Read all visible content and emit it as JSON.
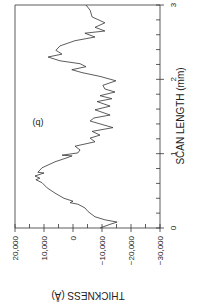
{
  "chart_data": {
    "type": "line",
    "orientation": "rotated-90",
    "panel_label": "(b)",
    "title": "",
    "xlabel": "SCAN LENGTH (mm)",
    "ylabel": "THICKNESS (Å)",
    "xlim": [
      0,
      3
    ],
    "ylim": [
      -30000,
      20000
    ],
    "x_ticks": [
      "0",
      "1",
      "2",
      "3"
    ],
    "y_ticks": [
      "20,000",
      "10,000",
      "0",
      "-10,000",
      "-20,000",
      "-30,000"
    ],
    "grid": false,
    "legend": null,
    "series": [
      {
        "name": "thickness profile",
        "x": [
          0.0,
          0.05,
          0.08,
          0.11,
          0.15,
          0.22,
          0.27,
          0.32,
          0.34,
          0.36,
          0.4,
          0.47,
          0.54,
          0.61,
          0.65,
          0.67,
          0.7,
          0.74,
          0.75,
          0.81,
          0.89,
          0.94,
          0.97,
          0.98,
          1.01,
          1.05,
          1.1,
          1.16,
          1.21,
          1.25,
          1.3,
          1.35,
          1.4,
          1.44,
          1.48,
          1.52,
          1.59,
          1.64,
          1.7,
          1.74,
          1.78,
          1.83,
          1.87,
          1.92,
          1.98,
          2.04,
          2.09,
          2.13,
          2.17,
          2.21,
          2.25,
          2.3,
          2.34,
          2.39,
          2.45,
          2.52,
          2.57,
          2.62,
          2.65,
          2.7,
          2.76,
          2.84,
          2.93,
          3.0
        ],
        "y": [
          -9300,
          -12800,
          -15200,
          -11000,
          -7600,
          -5200,
          -4100,
          -1700,
          1000,
          0,
          3100,
          6200,
          8900,
          10700,
          12800,
          11400,
          13100,
          10000,
          12100,
          10700,
          6200,
          2400,
          300,
          3800,
          -1700,
          -2400,
          -700,
          -7600,
          -5900,
          -9300,
          -6600,
          -13800,
          -9300,
          -5900,
          -7200,
          -12800,
          -7600,
          -12800,
          -8300,
          -13400,
          -9300,
          -14500,
          -11000,
          -10300,
          -14800,
          -9300,
          -3100,
          400,
          -4500,
          -2400,
          4500,
          8600,
          3800,
          5900,
          4500,
          -700,
          -7600,
          -4100,
          -11000,
          -7600,
          -11000,
          -6600,
          -5900,
          -4500
        ]
      }
    ]
  }
}
